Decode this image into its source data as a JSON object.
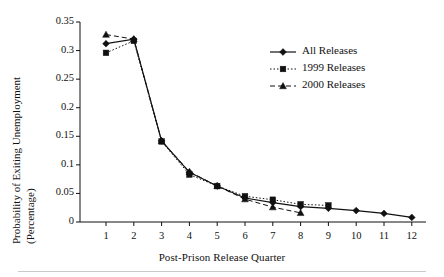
{
  "figure": {
    "background_color": "#ffffff",
    "ink_color": "#111111"
  },
  "axes": {
    "y_title_line1": "Probability of Exiting Unemployment",
    "y_title_line2": "(Percentage)",
    "x_title": "Post-Prison Release Quarter",
    "y_ticks": [
      "0",
      "0.05",
      "0.1",
      "0.15",
      "0.2",
      "0.25",
      "0.3",
      "0.35"
    ],
    "x_ticks": [
      "1",
      "2",
      "3",
      "4",
      "5",
      "6",
      "7",
      "8",
      "9",
      "10",
      "11",
      "12"
    ]
  },
  "legend": {
    "items": [
      {
        "label": "All Releases",
        "marker": "diamond",
        "line": "solid"
      },
      {
        "label": "1999 Releases",
        "marker": "square",
        "line": "dotted"
      },
      {
        "label": "2000 Releases",
        "marker": "triangle",
        "line": "dashed"
      }
    ]
  },
  "chart_data": {
    "type": "line",
    "title": "",
    "subtitle": "",
    "xlabel": "Post-Prison Release Quarter",
    "ylabel": "Probability of Exiting Unemployment (Percentage)",
    "x": [
      1,
      2,
      3,
      4,
      5,
      6,
      7,
      8,
      9,
      10,
      11,
      12
    ],
    "xlim": [
      1,
      12
    ],
    "ylim": [
      0,
      0.35
    ],
    "yticks": [
      0,
      0.05,
      0.1,
      0.15,
      0.2,
      0.25,
      0.3,
      0.35
    ],
    "xticks": [
      1,
      2,
      3,
      4,
      5,
      6,
      7,
      8,
      9,
      10,
      11,
      12
    ],
    "grid": false,
    "legend_position": "upper right",
    "series": [
      {
        "name": "All Releases",
        "marker": "diamond",
        "linestyle": "solid",
        "color": "#111111",
        "x": [
          1,
          2,
          3,
          4,
          5,
          6,
          7,
          8,
          9,
          10,
          11,
          12
        ],
        "values": [
          0.312,
          0.32,
          0.142,
          0.087,
          0.063,
          0.042,
          0.034,
          0.027,
          0.024,
          0.02,
          0.015,
          0.008
        ]
      },
      {
        "name": "1999 Releases",
        "marker": "square",
        "linestyle": "dotted",
        "color": "#111111",
        "x": [
          1,
          2,
          3,
          4,
          5,
          6,
          7,
          8,
          9
        ],
        "values": [
          0.296,
          0.317,
          0.141,
          0.083,
          0.063,
          0.045,
          0.039,
          0.031,
          0.029
        ]
      },
      {
        "name": "2000 Releases",
        "marker": "triangle",
        "linestyle": "dashed",
        "color": "#111111",
        "x": [
          1,
          2,
          3,
          4,
          5,
          6,
          7,
          8
        ],
        "values": [
          0.328,
          0.32,
          0.142,
          0.088,
          0.063,
          0.04,
          0.026,
          0.016
        ]
      }
    ]
  }
}
